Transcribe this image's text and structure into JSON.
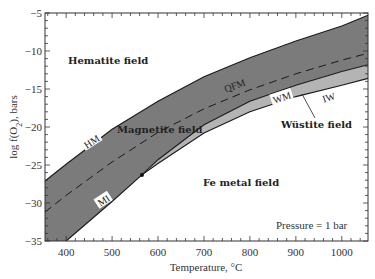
{
  "chart_data": {
    "type": "line",
    "title": "",
    "xlabel": "Temperature, °C",
    "ylabel": "log f(O2), bars",
    "xlim": [
      354,
      1057
    ],
    "ylim": [
      -35,
      -5
    ],
    "grid": false,
    "x_ticks": [
      400,
      500,
      600,
      700,
      800,
      900,
      1000
    ],
    "y_ticks": [
      -5,
      -10,
      -15,
      -20,
      -25,
      -30,
      -35
    ],
    "series": [
      {
        "name": "HM",
        "style": "solid",
        "points": [
          [
            354,
            -27.1
          ],
          [
            400,
            -24.9
          ],
          [
            500,
            -20.3
          ],
          [
            600,
            -16.6
          ],
          [
            700,
            -13.4
          ],
          [
            800,
            -10.9
          ],
          [
            900,
            -8.7
          ],
          [
            1000,
            -6.7
          ],
          [
            1057,
            -5.3
          ]
        ]
      },
      {
        "name": "QFM",
        "style": "dashed",
        "points": [
          [
            354,
            -31.2
          ],
          [
            400,
            -29.0
          ],
          [
            500,
            -24.6
          ],
          [
            600,
            -20.7
          ],
          [
            700,
            -17.6
          ],
          [
            800,
            -15.1
          ],
          [
            900,
            -13.0
          ],
          [
            1000,
            -11.2
          ],
          [
            1057,
            -10.3
          ]
        ]
      },
      {
        "name": "MI",
        "style": "solid",
        "points": [
          [
            400,
            -35.0
          ],
          [
            500,
            -29.8
          ],
          [
            565,
            -26.3
          ]
        ]
      },
      {
        "name": "WM",
        "style": "solid",
        "points": [
          [
            565,
            -26.3
          ],
          [
            600,
            -24.3
          ],
          [
            700,
            -19.7
          ],
          [
            800,
            -16.6
          ],
          [
            900,
            -14.5
          ],
          [
            1000,
            -12.7
          ],
          [
            1057,
            -11.8
          ]
        ]
      },
      {
        "name": "IW",
        "style": "solid",
        "points": [
          [
            565,
            -26.3
          ],
          [
            600,
            -24.8
          ],
          [
            700,
            -20.8
          ],
          [
            800,
            -18.0
          ],
          [
            900,
            -16.0
          ],
          [
            1000,
            -14.5
          ],
          [
            1057,
            -13.6
          ]
        ]
      }
    ],
    "triple_point": [
      565,
      -26.3
    ],
    "fields": [
      {
        "name": "Hematite field",
        "x": 390,
        "y": -12.0
      },
      {
        "name": "Magnetite field",
        "x": 520,
        "y": -21.2
      },
      {
        "name": "Wüstite field",
        "x": 860,
        "y": -20.4
      },
      {
        "name": "Fe metal field",
        "x": 695,
        "y": -28.0
      }
    ],
    "annotations": [
      {
        "text": "Pressure = 1 bar",
        "x": 860,
        "y": -33.2
      }
    ],
    "colors": {
      "magnetite_fill": "#7b7b7b",
      "wustite_fill": "#b4b4b4",
      "line": "#1a1a1a"
    }
  },
  "labels": {
    "xlabel": "Temperature, °C",
    "ylabel_prefix": "log f(O",
    "ylabel_sub": "2",
    "ylabel_suffix": "), bars",
    "hematite": "Hematite field",
    "magnetite": "Magnetite field",
    "wustite": "Wüstite field",
    "fe_metal": "Fe metal field",
    "pressure": "Pressure = 1 bar",
    "HM": "HM",
    "QFM": "QFM",
    "MI": "MI",
    "WM": "WM",
    "IW": "IW"
  }
}
